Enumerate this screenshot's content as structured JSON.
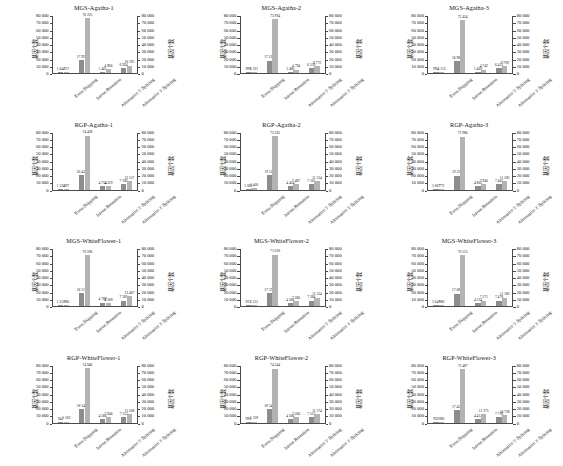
{
  "figure": {
    "axis_title_left": "基因个数",
    "axis_title_right": "基因个数",
    "categories": [
      "Exon Skipping",
      "Intron Retention",
      "Alternative 5' Splicing",
      "Alternative 3' Splicing"
    ],
    "y_ticks": [
      "0",
      "10 000",
      "20 000",
      "30 000",
      "40 000",
      "50 000",
      "60 000",
      "70 000",
      "80 000"
    ],
    "y_min": 0,
    "y_max": 80000,
    "series_colors": [
      "#8d8d8d",
      "#b3b3b3"
    ],
    "rows": 4,
    "cols": 3
  },
  "chart_data": [
    {
      "type": "bar",
      "title": "MGS-Agatha-1",
      "xlabel": "",
      "ylabel": "基因个数",
      "ylim": [
        0,
        80000
      ],
      "grid": false,
      "legend": "none",
      "categories": [
        "Exon Skipping",
        "Intron Retention",
        "Alternative 5' Splicing",
        "Alternative 3' Splicing"
      ],
      "series": [
        {
          "name": "series-1",
          "values": [
            1044,
            17922,
            1461,
            6924
          ],
          "labels": [
            "1 044",
            "17 922",
            "1 461",
            "6 924"
          ]
        },
        {
          "name": "series-2",
          "values": [
            757,
            76225,
            4966,
            10195
          ],
          "labels": [
            "757",
            "76 225",
            "4 966",
            "10 195"
          ]
        }
      ]
    },
    {
      "type": "bar",
      "title": "MGS-Agatha-2",
      "xlabel": "",
      "ylabel": "基因个数",
      "ylim": [
        0,
        80000
      ],
      "grid": false,
      "legend": "none",
      "categories": [
        "Exon Skipping",
        "Intron Retention",
        "Alternative 5' Splicing",
        "Alternative 3' Splicing"
      ],
      "series": [
        {
          "name": "series-1",
          "values": [
            998,
            17219,
            1480,
            6539
          ],
          "labels": [
            "998",
            "17 219",
            "1 480",
            "6 539"
          ]
        },
        {
          "name": "series-2",
          "values": [
            1221,
            73994,
            4794,
            9772
          ],
          "labels": [
            "1 221",
            "73 994",
            "4 794",
            "9 772"
          ]
        }
      ]
    },
    {
      "type": "bar",
      "title": "MGS-Agatha-3",
      "xlabel": "",
      "ylabel": "基因个数",
      "ylim": [
        0,
        80000
      ],
      "grid": false,
      "legend": "none",
      "categories": [
        "Exon Skipping",
        "Intron Retention",
        "Alternative 5' Splicing",
        "Alternative 3' Splicing"
      ],
      "series": [
        {
          "name": "series-1",
          "values": [
            994,
            16985,
            1469,
            6455
          ],
          "labels": [
            "994",
            "16 985",
            "1 469",
            "6 455"
          ]
        },
        {
          "name": "series-2",
          "values": [
            1155,
            72454,
            4742,
            9709
          ],
          "labels": [
            "1 155",
            "72 454",
            "4 742",
            "9 709"
          ]
        }
      ]
    },
    {
      "type": "bar",
      "title": "RGP-Agatha-1",
      "xlabel": "",
      "ylabel": "基因个数",
      "ylim": [
        0,
        80000
      ],
      "grid": false,
      "legend": "none",
      "categories": [
        "Exon Skipping",
        "Intron Retention",
        "Alternative 5' Splicing",
        "Alternative 3' Splicing"
      ],
      "series": [
        {
          "name": "series-1",
          "values": [
            1124,
            20434,
            4714,
            7160
          ],
          "labels": [
            "1 124",
            "20 434",
            "4 714",
            "7 160"
          ]
        },
        {
          "name": "series-2",
          "values": [
            697,
            74428,
            4329,
            12157
          ],
          "labels": [
            "697",
            "74 428",
            "4 329",
            "12 157"
          ]
        }
      ]
    },
    {
      "type": "bar",
      "title": "RGP-Agatha-2",
      "xlabel": "",
      "ylabel": "基因个数",
      "ylim": [
        0,
        80000
      ],
      "grid": false,
      "legend": "none",
      "categories": [
        "Exon Skipping",
        "Intron Retention",
        "Alternative 5' Splicing",
        "Alternative 3' Splicing"
      ],
      "series": [
        {
          "name": "series-1",
          "values": [
            1083,
            19511,
            4424,
            7161
          ],
          "labels": [
            "1 083",
            "19 511",
            "4 424",
            "7 161"
          ]
        },
        {
          "name": "series-2",
          "values": [
            1400,
            73565,
            7487,
            11534
          ],
          "labels": [
            "1 400",
            "73 565",
            "7 487",
            "11 534"
          ]
        }
      ]
    },
    {
      "type": "bar",
      "title": "RGP-Agatha-3",
      "xlabel": "",
      "ylabel": "基因个数",
      "ylim": [
        0,
        80000
      ],
      "grid": false,
      "legend": "none",
      "categories": [
        "Exon Skipping",
        "Intron Retention",
        "Alternative 5' Splicing",
        "Alternative 3' Splicing"
      ],
      "series": [
        {
          "name": "series-1",
          "values": [
            1067,
            19327,
            4862,
            7462
          ],
          "labels": [
            "1 067",
            "19 327",
            "4 862",
            "7 462"
          ]
        },
        {
          "name": "series-2",
          "values": [
            772,
            72986,
            7940,
            11585
          ],
          "labels": [
            "772",
            "72 986",
            "7 940",
            "11 585"
          ]
        }
      ]
    },
    {
      "type": "bar",
      "title": "MGS-WhiteFlower-1",
      "xlabel": "",
      "ylabel": "基因个数",
      "ylim": [
        0,
        80000
      ],
      "grid": false,
      "legend": "none",
      "categories": [
        "Exon Skipping",
        "Intron Retention",
        "Alternative 5' Splicing",
        "Alternative 3' Splicing"
      ],
      "series": [
        {
          "name": "series-1",
          "values": [
            1212,
            18115,
            4788,
            7385
          ],
          "labels": [
            "1 212",
            "18 115",
            "4 788",
            "7 385"
          ]
        },
        {
          "name": "series-2",
          "values": [
            986,
            70596,
            4188,
            13407
          ],
          "labels": [
            "986",
            "70 596",
            "4 188",
            "13 407"
          ]
        }
      ]
    },
    {
      "type": "bar",
      "title": "MGS-WhiteFlower-2",
      "xlabel": "",
      "ylabel": "基因个数",
      "ylim": [
        0,
        80000
      ],
      "grid": false,
      "legend": "none",
      "categories": [
        "Exon Skipping",
        "Intron Retention",
        "Alternative 5' Splicing",
        "Alternative 3' Splicing"
      ],
      "series": [
        {
          "name": "series-1",
          "values": [
            922,
            17372,
            4566,
            7384
          ],
          "labels": [
            "922",
            "17 372",
            "4 566",
            "7 384"
          ]
        },
        {
          "name": "series-2",
          "values": [
            1251,
            71030,
            7266,
            11534
          ],
          "labels": [
            "1 251",
            "71 030",
            "7 266",
            "11 534"
          ]
        }
      ]
    },
    {
      "type": "bar",
      "title": "MGS-WhiteFlower-3",
      "xlabel": "",
      "ylabel": "基因个数",
      "ylim": [
        0,
        80000
      ],
      "grid": false,
      "legend": "none",
      "categories": [
        "Exon Skipping",
        "Intron Retention",
        "Alternative 5' Splicing",
        "Alternative 3' Splicing"
      ],
      "series": [
        {
          "name": "series-1",
          "values": [
            1047,
            17085,
            4334,
            7478
          ],
          "labels": [
            "1 047",
            "17 085",
            "4 334",
            "7 478"
          ]
        },
        {
          "name": "series-2",
          "values": [
            880,
            70513,
            7571,
            11582
          ],
          "labels": [
            "880",
            "70 513",
            "7 571",
            "11 582"
          ]
        }
      ]
    },
    {
      "type": "bar",
      "title": "RGP-WhiteFlower-1",
      "xlabel": "",
      "ylabel": "基因个数",
      "ylim": [
        0,
        80000
      ],
      "grid": false,
      "legend": "none",
      "categories": [
        "Exon Skipping",
        "Intron Retention",
        "Alternative 5' Splicing",
        "Alternative 3' Splicing"
      ],
      "series": [
        {
          "name": "series-1",
          "values": [
            941,
            18348,
            4566,
            7112
          ],
          "labels": [
            "941",
            "18 348",
            "4 566",
            "7 112"
          ]
        },
        {
          "name": "series-2",
          "values": [
            1182,
            74946,
            7946,
            11308
          ],
          "labels": [
            "1 182",
            "74 946",
            "7 946",
            "11 308"
          ]
        }
      ]
    },
    {
      "type": "bar",
      "title": "RGP-WhiteFlower-2",
      "xlabel": "",
      "ylabel": "基因个数",
      "ylim": [
        0,
        80000
      ],
      "grid": false,
      "legend": "none",
      "categories": [
        "Exon Skipping",
        "Intron Retention",
        "Alternative 5' Splicing",
        "Alternative 3' Splicing"
      ],
      "series": [
        {
          "name": "series-1",
          "values": [
            996,
            18344,
            4566,
            7512
          ],
          "labels": [
            "996",
            "18 344",
            "4 566",
            "7 512"
          ]
        },
        {
          "name": "series-2",
          "values": [
            1359,
            74344,
            7266,
            11574
          ],
          "labels": [
            "1 359",
            "74 344",
            "7 266",
            "11 574"
          ]
        }
      ]
    },
    {
      "type": "bar",
      "title": "RGP-WhiteFlower-3",
      "xlabel": "",
      "ylabel": "基因个数",
      "ylim": [
        0,
        80000
      ],
      "grid": false,
      "legend": "none",
      "categories": [
        "Exon Skipping",
        "Intron Retention",
        "Alternative 5' Splicing",
        "Alternative 3' Splicing"
      ],
      "series": [
        {
          "name": "series-1",
          "values": [
            930,
            17451,
            4412,
            7738
          ],
          "labels": [
            "930",
            "17 451",
            "4 412",
            "7 738"
          ]
        },
        {
          "name": "series-2",
          "values": [
            980,
            73487,
            11275,
            10738
          ],
          "labels": [
            "980",
            "73 487",
            "11 275",
            "10 738"
          ]
        }
      ]
    }
  ]
}
